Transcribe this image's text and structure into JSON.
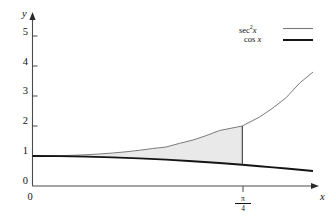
{
  "chart_data": {
    "type": "line",
    "title": "",
    "xlabel": "x",
    "ylabel": "y",
    "xlim": [
      0,
      1.05
    ],
    "ylim": [
      0,
      5.6
    ],
    "grid": false,
    "legend_position": "top-right",
    "y_ticks": [
      "0",
      "1",
      "2",
      "3",
      "4",
      "5"
    ],
    "y_tick_values": [
      0,
      1,
      2,
      3,
      4,
      5
    ],
    "x_ticks": [
      "0",
      "π/4"
    ],
    "x_tick_values": [
      0,
      0.7853981634
    ],
    "x_origin_label": "0",
    "series": [
      {
        "name": "sec² x",
        "color": "#7a7a7a",
        "width": 1.0,
        "x": [
          0,
          0.05,
          0.1,
          0.15,
          0.2,
          0.25,
          0.3,
          0.35,
          0.4,
          0.45,
          0.5,
          0.55,
          0.6,
          0.65,
          0.7,
          0.7853981634,
          0.85,
          0.9,
          0.95,
          1.0,
          1.05
        ],
        "values": [
          1.0,
          1.005,
          1.01,
          1.023,
          1.041,
          1.067,
          1.099,
          1.14,
          1.19,
          1.25,
          1.3,
          1.42,
          1.53,
          1.68,
          1.85,
          2.0,
          2.3,
          2.6,
          2.95,
          3.43,
          3.8
        ]
      },
      {
        "name": "cos x",
        "color": "#141414",
        "width": 1.9,
        "x": [
          0,
          0.1,
          0.2,
          0.3,
          0.4,
          0.5,
          0.6,
          0.7,
          0.7853981634,
          0.85,
          0.9,
          0.95,
          1.0,
          1.05
        ],
        "values": [
          1.0,
          0.995,
          0.98,
          0.955,
          0.921,
          0.878,
          0.825,
          0.765,
          0.7071,
          0.66,
          0.622,
          0.582,
          0.54,
          0.498
        ]
      }
    ],
    "shaded_region": {
      "label": "area between sec² x and cos x",
      "fill": "#e9e9e9",
      "x_from": 0,
      "x_to": 0.7853981634,
      "upper_series": "sec² x",
      "lower_series": "cos x"
    },
    "boundary_line": {
      "x": 0.7853981634,
      "y_from": 0.7071,
      "y_to": 2.0,
      "color": "#3a3a3a"
    }
  },
  "axes": {
    "y_axis_label": "y",
    "x_axis_label": "x",
    "origin_label": "0"
  },
  "y_tick_labels": [
    "5",
    "4",
    "3",
    "2",
    "1",
    "0"
  ],
  "x_tick_pi_over_four": {
    "numerator": "π",
    "denominator": "4"
  },
  "legend": {
    "items": [
      {
        "base": "sec",
        "exponent": "2",
        "variable": "x",
        "color": "#7a7a7a",
        "line_width": "1px"
      },
      {
        "base": "cos",
        "exponent": "",
        "variable": "x",
        "color": "#141414",
        "line_width": "2px"
      }
    ]
  },
  "colors": {
    "background": "#ffffff",
    "axis": "#4a4a4a",
    "sec_curve": "#7a7a7a",
    "cos_curve": "#141414",
    "shade": "#e9e9e9",
    "text": "#111111"
  }
}
